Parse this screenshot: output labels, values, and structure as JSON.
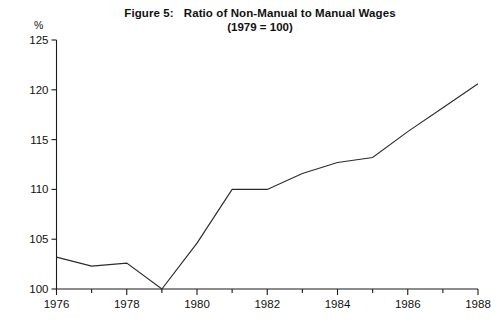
{
  "figure": {
    "number_label": "Figure 5:",
    "title": "Ratio of Non-Manual to Manual Wages",
    "subtitle": "(1979 = 100)",
    "unit_label": "%"
  },
  "chart_data": {
    "type": "line",
    "subtitle": "(1979 = 100)",
    "xlabel": "",
    "ylabel": "%",
    "xlim": [
      1976,
      1988
    ],
    "ylim": [
      100,
      125
    ],
    "grid": false,
    "legend": "none",
    "y_ticks": [
      100,
      105,
      110,
      115,
      120,
      125
    ],
    "y_tick_labels": [
      "100",
      "105",
      "110",
      "115",
      "120",
      "125"
    ],
    "x_ticks": [
      1976,
      1977,
      1978,
      1979,
      1980,
      1981,
      1982,
      1983,
      1984,
      1985,
      1986,
      1987,
      1988
    ],
    "x_tick_labels_shown": [
      "1976",
      "1978",
      "1980",
      "1982",
      "1984",
      "1986",
      "1988"
    ],
    "x": [
      1976,
      1977,
      1978,
      1979,
      1980,
      1981,
      1982,
      1983,
      1984,
      1985,
      1986,
      1987,
      1988
    ],
    "values": [
      103.2,
      102.3,
      102.6,
      100.0,
      104.6,
      110.0,
      110.0,
      111.6,
      112.7,
      113.2,
      115.8,
      118.2,
      120.6
    ],
    "series": [
      {
        "name": "Ratio of non-manual to manual wages",
        "values": [
          103.2,
          102.3,
          102.6,
          100.0,
          104.6,
          110.0,
          110.0,
          111.6,
          112.7,
          113.2,
          115.8,
          118.2,
          120.6
        ]
      }
    ],
    "line_color": "#2b2b2b"
  }
}
